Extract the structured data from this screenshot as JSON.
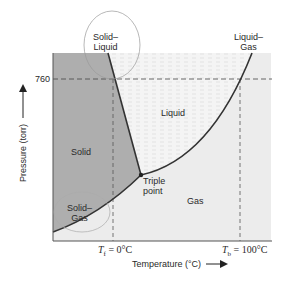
{
  "diagram": {
    "regions": {
      "solid": "Solid",
      "liquid": "Liquid",
      "gas": "Gas"
    },
    "boundaries": {
      "solid_liquid_line1": "Solid–",
      "solid_liquid_line2": "Liquid",
      "liquid_gas_line1": "Liquid–",
      "liquid_gas_line2": "Gas",
      "solid_gas_line1": "Solid–",
      "solid_gas_line2": "Gas"
    },
    "triple_point_line1": "Triple",
    "triple_point_line2": "point",
    "y_tick": "760",
    "y_axis_label": "Pressure (torr)",
    "x_axis_label": "Temperature (°C)",
    "tf_label": "T",
    "tf_sub": "f",
    "tf_value": " = 0°C",
    "tb_label": "T",
    "tb_sub": "b",
    "tb_value": " = 100°C",
    "colors": {
      "solid_fill": "#aeaeae",
      "liquid_fill": "#f3f3f3",
      "gas_fill": "#ececec",
      "curve": "#333333"
    }
  }
}
